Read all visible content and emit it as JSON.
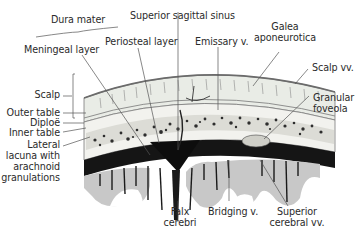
{
  "figure": {
    "colors": {
      "background": "#ffffff",
      "text": "#2b2b2b",
      "leader_line": "#555555",
      "scalp": "#e9ece6",
      "bone": "#f2f2ee",
      "diploe_spots": "#2e2e2e",
      "dura_dark": "#151515",
      "cortex_gray": "#c8c8c8"
    }
  },
  "labels": {
    "dura_mater": "Dura mater",
    "superior_sagittal_sinus": "Superior sagittal sinus",
    "meningeal_layer": "Meningeal layer",
    "periosteal_layer": "Periosteal layer",
    "emissary_v": "Emissary v.",
    "galea_line1": "Galea",
    "galea_line2": "aponeurotica",
    "scalp_vv": "Scalp vv.",
    "scalp": "Scalp",
    "granular_line1": "Granular",
    "granular_line2": "foveola",
    "outer_table": "Outer table",
    "diploe": "Diploë",
    "inner_table": "Inner table",
    "lateral_line1": "Lateral",
    "lateral_line2": "lacuna with",
    "lateral_line3": "arachnoid",
    "lateral_line4": "granulations",
    "falx_line1": "Falx",
    "falx_line2": "cerebri",
    "bridging_v": "Bridging v.",
    "sup_cerebral_line1": "Superior",
    "sup_cerebral_line2": "cerebral vv."
  }
}
